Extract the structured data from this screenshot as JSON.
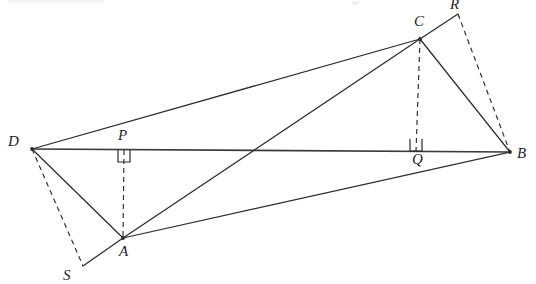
{
  "figure": {
    "width": 536,
    "height": 284,
    "background_color": "#ffffff",
    "line_color": "#2b2b2b",
    "points": {
      "A": {
        "label": "A",
        "x": 123,
        "y": 238,
        "label_x": 119,
        "label_y": 244
      },
      "B": {
        "label": "B",
        "x": 510,
        "y": 152,
        "label_x": 517,
        "label_y": 146
      },
      "C": {
        "label": "C",
        "x": 420,
        "y": 39,
        "label_x": 414,
        "label_y": 14
      },
      "D": {
        "label": "D",
        "x": 32,
        "y": 149,
        "label_x": 8,
        "label_y": 134
      },
      "P": {
        "label": "P",
        "x": 124,
        "y": 150,
        "label_x": 118,
        "label_y": 128
      },
      "Q": {
        "label": "Q",
        "x": 416,
        "y": 151,
        "label_x": 412,
        "label_y": 152
      },
      "R": {
        "label": "R",
        "x": 458,
        "y": 14,
        "label_x": 450,
        "label_y": -3
      },
      "S": {
        "label": "S",
        "x": 83,
        "y": 266,
        "label_x": 63,
        "label_y": 268
      }
    },
    "solid_segments": [
      {
        "name": "segment-D-B",
        "from": "D",
        "to": "B"
      },
      {
        "name": "segment-D-C",
        "from": "D",
        "to": "C"
      },
      {
        "name": "segment-D-A",
        "from": "D",
        "to": "A"
      },
      {
        "name": "segment-A-C",
        "from": "A",
        "to": "C"
      },
      {
        "name": "segment-A-B",
        "from": "A",
        "to": "B"
      },
      {
        "name": "segment-C-B",
        "from": "C",
        "to": "B"
      },
      {
        "name": "segment-C-R",
        "from": "C",
        "to": "R"
      },
      {
        "name": "segment-A-S",
        "from": "A",
        "to": "S"
      }
    ],
    "dashed_segments": [
      {
        "name": "segment-P-A",
        "from": "P",
        "to": "A"
      },
      {
        "name": "segment-C-Q",
        "from": "C",
        "to": "Q"
      },
      {
        "name": "segment-D-S",
        "from": "D",
        "to": "S"
      },
      {
        "name": "segment-R-B",
        "from": "R",
        "to": "B"
      }
    ],
    "right_angle_marks": [
      {
        "name": "right-angle-at-P",
        "at": "P",
        "side": "below",
        "size": 12
      },
      {
        "name": "right-angle-at-Q",
        "at": "Q",
        "side": "above",
        "size": 12
      }
    ]
  }
}
